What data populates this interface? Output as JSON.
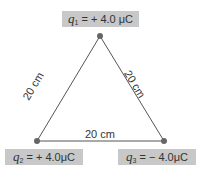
{
  "charges": [
    {
      "id": "q1",
      "symbol": "q",
      "subscript": "1",
      "value": "= + 4.0",
      "unit": "μC"
    },
    {
      "id": "q2",
      "symbol": "q",
      "subscript": "2",
      "value": "= + 4.0",
      "unit": "μC"
    },
    {
      "id": "q3",
      "symbol": "q",
      "subscript": "3",
      "value": "= − 4.0",
      "unit": "μC"
    }
  ],
  "distances": {
    "left": "20 cm",
    "right": "20 cm",
    "bottom": "20 cm"
  },
  "colors": {
    "label_bg": "#c8c8c8",
    "line": "#555555",
    "dot": "#666666"
  }
}
